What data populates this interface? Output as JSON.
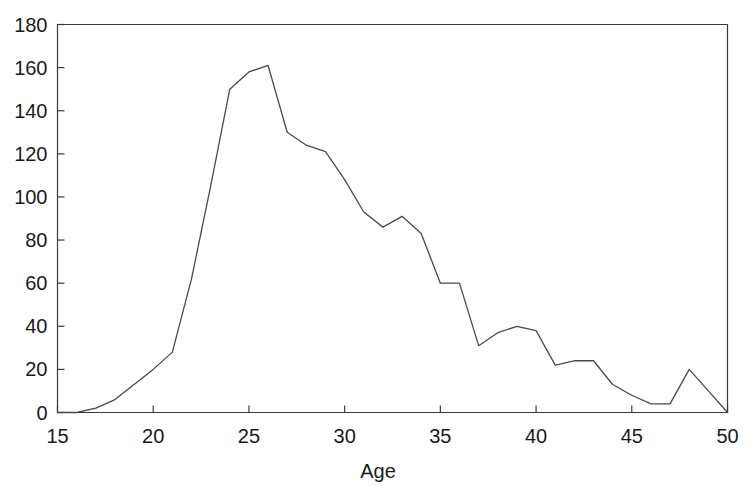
{
  "chart_data": {
    "type": "line",
    "title": "",
    "subtitle": "",
    "xlabel": "Age",
    "ylabel": "",
    "xlim": [
      15,
      50
    ],
    "ylim": [
      0,
      180
    ],
    "xticks": [
      15,
      20,
      25,
      30,
      35,
      40,
      45,
      50
    ],
    "yticks": [
      0,
      20,
      40,
      60,
      80,
      100,
      120,
      140,
      160,
      180
    ],
    "xtick_labels": [
      "15",
      "20",
      "25",
      "30",
      "35",
      "40",
      "45",
      "50"
    ],
    "ytick_labels": [
      "0",
      "20",
      "40",
      "60",
      "80",
      "100",
      "120",
      "140",
      "160",
      "180"
    ],
    "grid": false,
    "legend": null,
    "legend_position": "none",
    "annotations": [],
    "series": [
      {
        "name": "count",
        "color": "#4a4a4a",
        "x": [
          15,
          16,
          17,
          18,
          19,
          20,
          21,
          22,
          23,
          24,
          25,
          26,
          27,
          28,
          29,
          30,
          31,
          32,
          33,
          34,
          35,
          36,
          37,
          38,
          39,
          40,
          41,
          42,
          43,
          44,
          45,
          46,
          47,
          48,
          49,
          50
        ],
        "values": [
          0,
          0,
          2,
          6,
          13,
          20,
          28,
          62,
          105,
          150,
          158,
          161,
          130,
          124,
          121,
          108,
          93,
          86,
          91,
          83,
          60,
          60,
          31,
          37,
          40,
          38,
          22,
          24,
          24,
          13,
          8,
          4,
          4,
          20,
          10,
          0
        ]
      }
    ]
  },
  "figure": {
    "background_color": "#ffffff",
    "line_color": "#4a4a4a",
    "axis_color": "#3b3b3b",
    "text_color": "#1a1a1a"
  }
}
